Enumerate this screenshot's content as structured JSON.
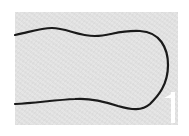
{
  "image": {
    "description": "Grayscale micrograph showing a dark outline of an elongated bulb-shaped cell, open on the left edge",
    "background_color": "#e4e4e4",
    "outline_color": "#1a1a1a",
    "border_color": "#ffffff"
  },
  "scale_bar": {
    "color": "#ffffff",
    "label": ""
  }
}
